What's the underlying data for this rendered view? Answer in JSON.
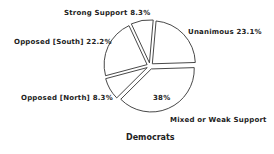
{
  "chart_data": {
    "type": "pie",
    "title": "Democrats",
    "exploded": true,
    "slices": [
      {
        "label": "Unanimous",
        "value": 23.1,
        "display": "Unanimous 23.1%"
      },
      {
        "label": "Mixed or Weak Support",
        "value": 38,
        "display": "Mixed or Weak Support",
        "inner_label": "38%"
      },
      {
        "label": "Opposed [North]",
        "value": 8.3,
        "display": "Opposed [North] 8.3%"
      },
      {
        "label": "Opposed [South]",
        "value": 22.2,
        "display": "Opposed [South] 22.2%"
      },
      {
        "label": "Strong Support",
        "value": 8.3,
        "display": "Strong Support 8.3%"
      }
    ],
    "start_angle_deg_from_top_clockwise": 5,
    "fill": "#ffffff",
    "stroke": "#333333"
  },
  "labels": {
    "unanimous": "Unanimous 23.1%",
    "mixed": "Mixed or Weak Support",
    "mixed_inner": "38%",
    "opposed_north": "Opposed [North] 8.3%",
    "opposed_south": "Opposed [South] 22.2%",
    "strong_support": "Strong Support 8.3%",
    "title": "Democrats"
  }
}
